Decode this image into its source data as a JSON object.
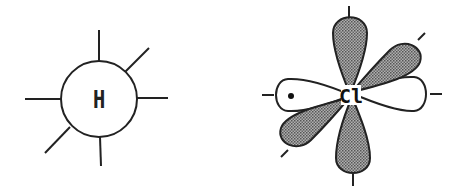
{
  "diagram": {
    "type": "orbital-diagram",
    "hydrogen": {
      "label": "H",
      "center": [
        99,
        97
      ],
      "radius": 38,
      "bond_lines": 6
    },
    "chlorine": {
      "label": "Cl",
      "center": [
        351,
        95
      ],
      "lobes": [
        {
          "name": "top",
          "shaded": true
        },
        {
          "name": "bottom",
          "shaded": true
        },
        {
          "name": "upper-right",
          "shaded": true
        },
        {
          "name": "lower-left",
          "shaded": true
        },
        {
          "name": "left",
          "shaded": false,
          "electron_dot": true
        },
        {
          "name": "right",
          "shaded": false
        }
      ]
    },
    "colors": {
      "stroke": "#222222",
      "shade": "#8a8a8a",
      "background": "#ffffff"
    }
  }
}
